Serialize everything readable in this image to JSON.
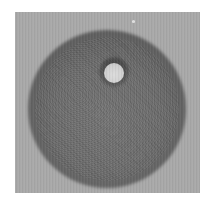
{
  "image": {
    "description": "Grayscale photograph of a dark circular disc on a light gray square background with a small bright circular spot near the upper right of the disc",
    "colors": {
      "frame": "#ffffff",
      "background": "#a9a9a9",
      "disc_center": "#737373",
      "disc_rim": "#5a5a5a",
      "bright_spot": "#d6d6d6"
    },
    "features": [
      {
        "name": "disc",
        "shape": "circle"
      },
      {
        "name": "bright-spot",
        "shape": "circle"
      },
      {
        "name": "speck",
        "shape": "dot"
      }
    ]
  }
}
